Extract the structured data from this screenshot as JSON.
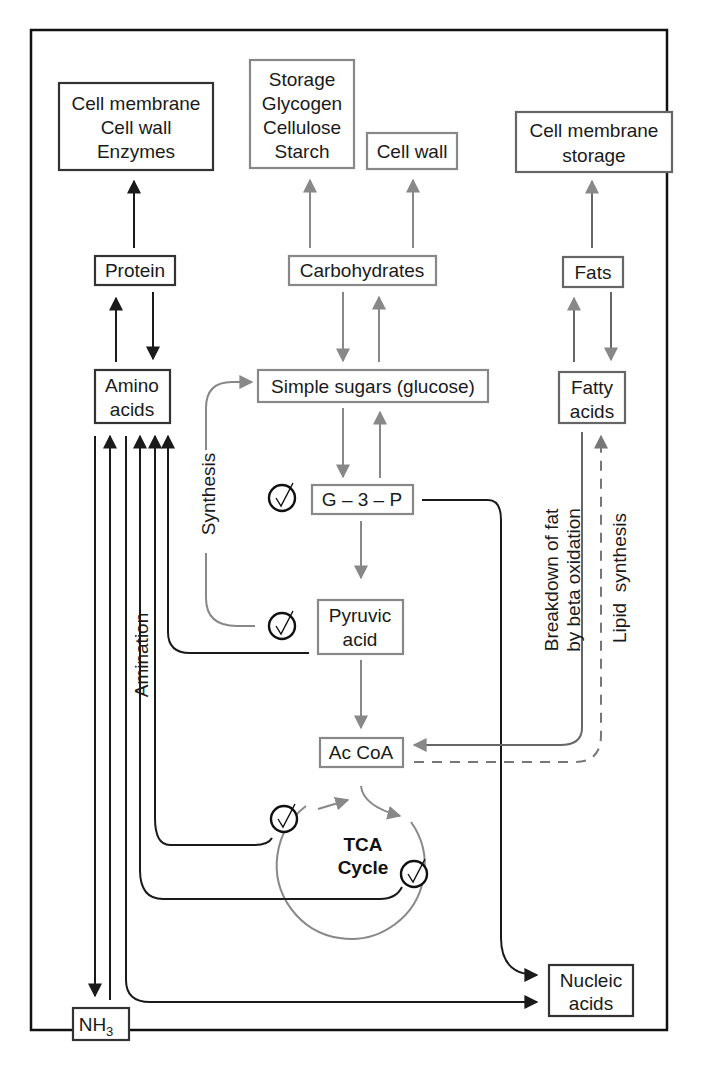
{
  "diagram": {
    "nodes": {
      "cell_membrane_wall_enzymes": [
        "Cell membrane",
        "Cell wall",
        "Enzymes"
      ],
      "storage_polysaccharides": [
        "Storage",
        "Glycogen",
        "Cellulose",
        "Starch"
      ],
      "cell_wall": [
        "Cell wall"
      ],
      "cell_membrane_storage": [
        "Cell membrane",
        "storage"
      ],
      "protein": "Protein",
      "carbohydrates": "Carbohydrates",
      "fats": "Fats",
      "amino_acids": [
        "Amino",
        "acids"
      ],
      "simple_sugars": "Simple sugars (glucose)",
      "fatty_acids": [
        "Fatty",
        "acids"
      ],
      "g3p": "G – 3 – P",
      "pyruvic_acid": [
        "Pyruvic",
        "acid"
      ],
      "ac_coa": "Ac CoA",
      "tca_cycle": [
        "TCA",
        "Cycle"
      ],
      "nucleic_acids": [
        "Nucleic",
        "acids"
      ],
      "nh3": "NH",
      "nh3_sub": "3"
    },
    "labels": {
      "synthesis": "Synthesis",
      "amination": "Amination",
      "beta_oxidation": [
        "Breakdown of fat",
        "by beta oxidation"
      ],
      "lipid_synthesis": "Lipid  synthesis"
    },
    "check_mark_glyph": "✓",
    "colors": {
      "dark": "#1a1a1a",
      "gray": "#888888",
      "dashed": "#777777"
    }
  }
}
